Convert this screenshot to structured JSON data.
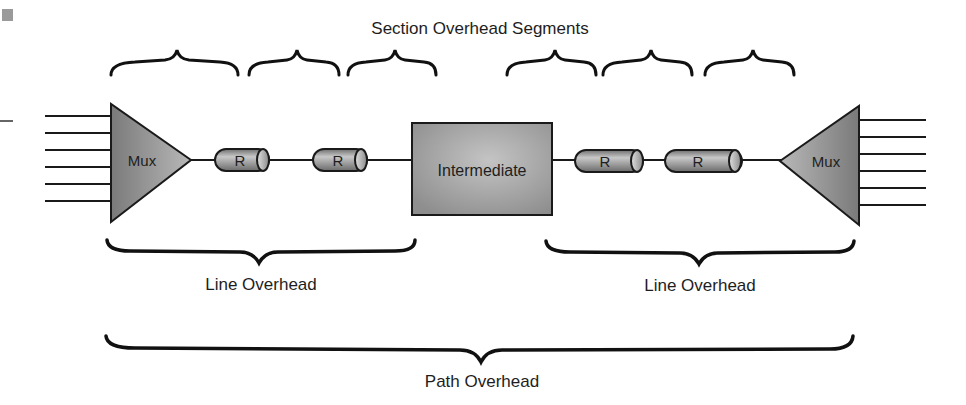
{
  "diagram": {
    "title": "Section Overhead Segments",
    "nodes": {
      "mux_left": "Mux",
      "repeater_1": "R",
      "repeater_2": "R",
      "intermediate": "Intermediate",
      "repeater_3": "R",
      "repeater_4": "R",
      "mux_right": "Mux"
    },
    "labels": {
      "line_overhead_left": "Line Overhead",
      "line_overhead_right": "Line Overhead",
      "path_overhead": "Path Overhead"
    },
    "section_segment_count": 6,
    "tributary_lines_per_mux": 6,
    "colors": {
      "shape_fill": "#8c8c8c",
      "shape_highlight": "#bdbdbd",
      "stroke": "#1a1a1a",
      "text": "#1e1e1e"
    }
  }
}
